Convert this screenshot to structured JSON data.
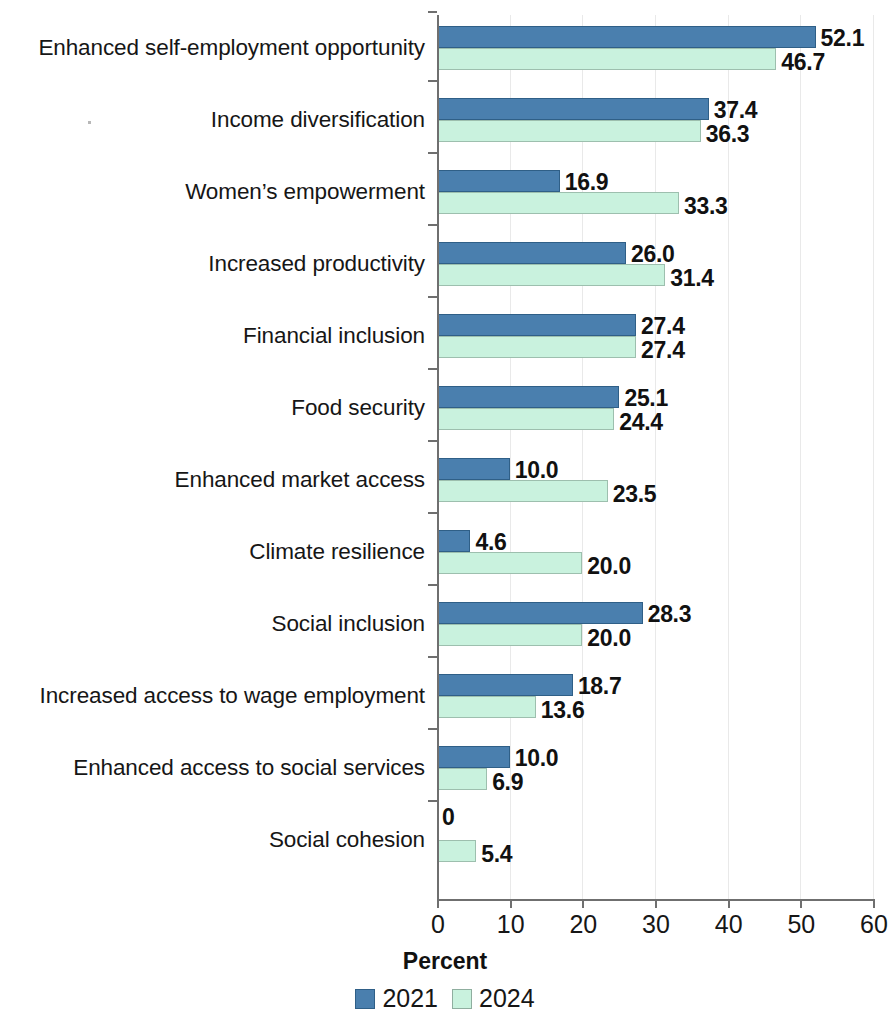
{
  "chart_data": {
    "type": "bar",
    "orientation": "horizontal",
    "title": "",
    "xlabel": "Percent",
    "ylabel": "",
    "xlim": [
      0,
      60
    ],
    "xticks": [
      0,
      10,
      20,
      30,
      40,
      50,
      60
    ],
    "xtick_labels": [
      "0",
      "10",
      "20",
      "30",
      "40",
      "50",
      "60"
    ],
    "grid": true,
    "legend_position": "bottom",
    "categories": [
      "Enhanced self-employment opportunity",
      "Income diversification",
      "Women’s empowerment",
      "Increased productivity",
      "Financial inclusion",
      "Food security",
      "Enhanced market access",
      "Climate resilience",
      "Social inclusion",
      "Increased access to wage employment",
      "Enhanced access to social services",
      "Social cohesion"
    ],
    "series": [
      {
        "name": "2021",
        "color": "#4a7fae",
        "values": [
          52.1,
          37.4,
          16.9,
          26.0,
          27.4,
          25.1,
          10.0,
          4.6,
          28.3,
          18.7,
          10.0,
          0
        ],
        "value_labels": [
          "52.1",
          "37.4",
          "16.9",
          "26.0",
          "27.4",
          "25.1",
          "10.0",
          "4.6",
          "28.3",
          "18.7",
          "10.0",
          "0"
        ]
      },
      {
        "name": "2024",
        "color": "#c9f2de",
        "values": [
          46.7,
          36.3,
          33.3,
          31.4,
          27.4,
          24.4,
          23.5,
          20.0,
          20.0,
          13.6,
          6.9,
          5.4
        ],
        "value_labels": [
          "46.7",
          "36.3",
          "33.3",
          "31.4",
          "27.4",
          "24.4",
          "23.5",
          "20.0",
          "20.0",
          "13.6",
          "6.9",
          "5.4"
        ]
      }
    ]
  },
  "legend": {
    "items": [
      {
        "label": "2021",
        "color": "#4a7fae"
      },
      {
        "label": "2024",
        "color": "#c9f2de"
      }
    ]
  }
}
